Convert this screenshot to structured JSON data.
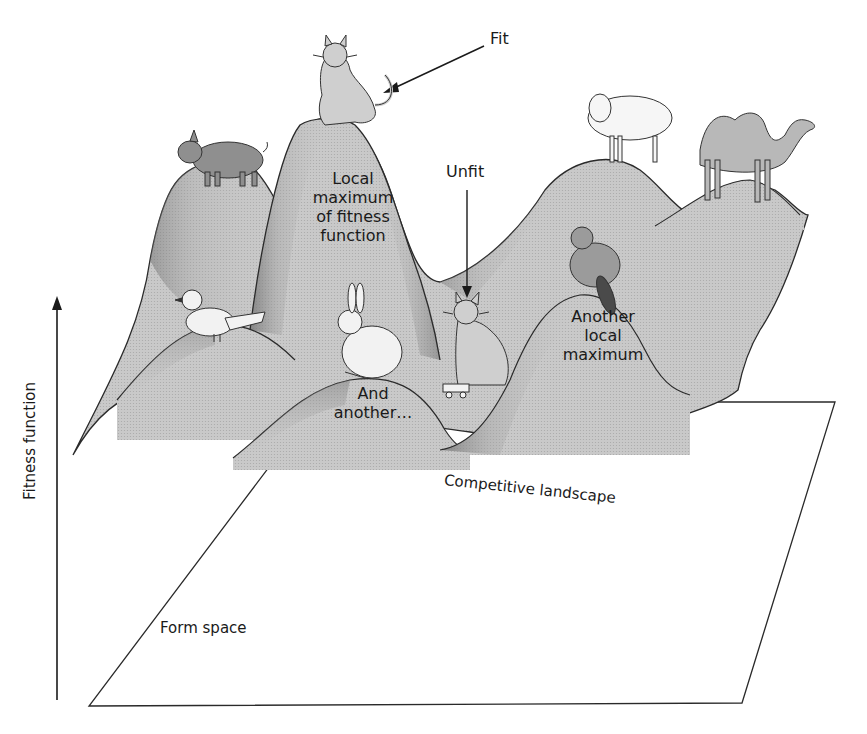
{
  "figure": {
    "axis": {
      "vertical_label": "Fitness function",
      "base_plane_label": "Form space"
    },
    "surface_label": "Competitive landscape",
    "annotations": {
      "fit": "Fit",
      "unfit": "Unfit",
      "peak_main": "Local maximum of fitness function",
      "peak_main_lines": [
        "Local",
        "maximum",
        "of fitness",
        "function"
      ],
      "peak_second_lines": [
        "Another",
        "local",
        "maximum"
      ],
      "peak_third_lines": [
        "And",
        "another…"
      ]
    },
    "animals": [
      {
        "name": "cat-fit",
        "position": "top of tallest peak"
      },
      {
        "name": "pig",
        "position": "left peak"
      },
      {
        "name": "bird",
        "position": "low left hill"
      },
      {
        "name": "rabbit",
        "position": "middle hill"
      },
      {
        "name": "cat-unfit",
        "position": "valley on roller skate"
      },
      {
        "name": "beaver",
        "position": "right-middle peak"
      },
      {
        "name": "sheep",
        "position": "back right ridge"
      },
      {
        "name": "camel",
        "position": "far right peak"
      }
    ],
    "colors": {
      "surface": "#c8c8c8",
      "surface_shadow": "#8a8a8a",
      "outline": "#2a2a2a",
      "background": "#ffffff"
    }
  }
}
